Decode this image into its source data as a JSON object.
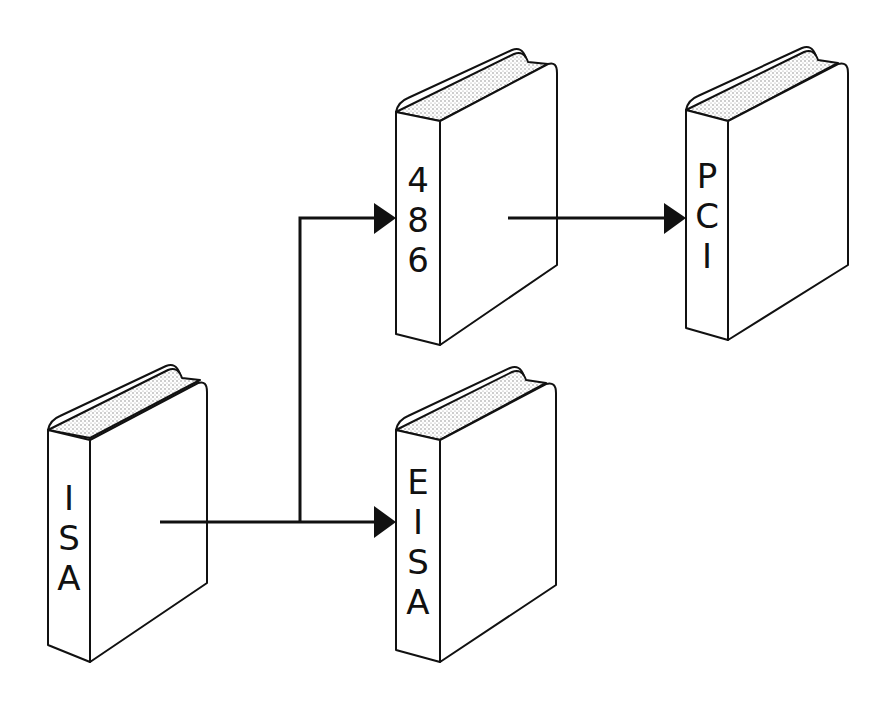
{
  "diagram": {
    "type": "bus-architecture-evolution",
    "books": [
      {
        "id": "isa",
        "label": "ISA",
        "letters": [
          "I",
          "S",
          "A"
        ]
      },
      {
        "id": "486",
        "label": "486",
        "letters": [
          "4",
          "8",
          "6"
        ]
      },
      {
        "id": "pci",
        "label": "PCI",
        "letters": [
          "P",
          "C",
          "I"
        ]
      },
      {
        "id": "eisa",
        "label": "EISA",
        "letters": [
          "E",
          "I",
          "S",
          "A"
        ]
      }
    ],
    "edges": [
      {
        "from": "ISA",
        "to": "EISA"
      },
      {
        "from": "ISA",
        "to": "486"
      },
      {
        "from": "486",
        "to": "PCI"
      }
    ],
    "colors": {
      "stroke": "#111111",
      "background": "#ffffff",
      "pages": "#bdbdbd"
    }
  }
}
